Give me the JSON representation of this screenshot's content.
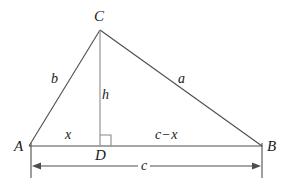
{
  "figure": {
    "background_color": "#ffffff",
    "stroke_color": "#4d4d4d",
    "text_color": "#1a1a1a"
  },
  "vertices": {
    "C": "C",
    "A": "A",
    "B": "B",
    "D": "D"
  },
  "segments": {
    "side_b": "b",
    "side_a": "a",
    "altitude_h": "h",
    "base_left_x": "x",
    "base_right_c_minus_x": "c − x",
    "c_minus_x_first": "c",
    "c_minus_x_operator": "−",
    "c_minus_x_second": "x"
  },
  "dimension": {
    "base_total_c": "c"
  },
  "markers": {
    "right_angle": "right-angle-marker"
  },
  "geometry": {
    "A": [
      29,
      146
    ],
    "B": [
      262,
      146
    ],
    "C": [
      100,
      30
    ],
    "D": [
      100,
      146
    ],
    "dimension_line_y": 166,
    "tick_top_y": 143,
    "tick_bottom_y": 178
  }
}
